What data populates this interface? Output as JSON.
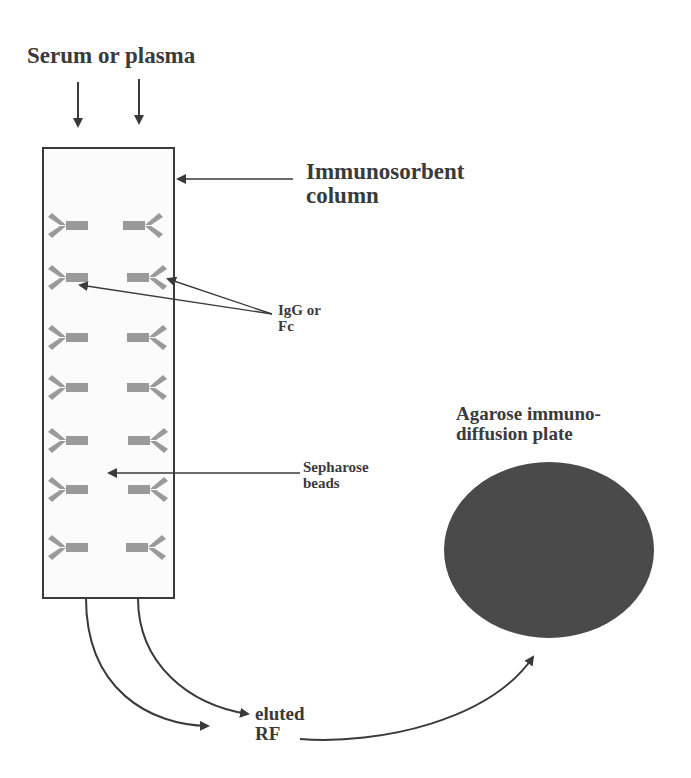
{
  "diagram": {
    "labels": {
      "input": "Serum or plasma",
      "column": "Immunosorbent\ncolumn",
      "ligand": "IgG or\nFc",
      "beads": "Sepharose\nbeads",
      "output": "eluted\nRF",
      "plate": "Agarose immuno-\ndiffusion plate"
    },
    "colors": {
      "ink": "#3a3a3a",
      "antibody": "#9a9a9a",
      "plate": "#4a4a4a",
      "column_fill": "#fbfbfb"
    },
    "antibody_rows": 7
  }
}
